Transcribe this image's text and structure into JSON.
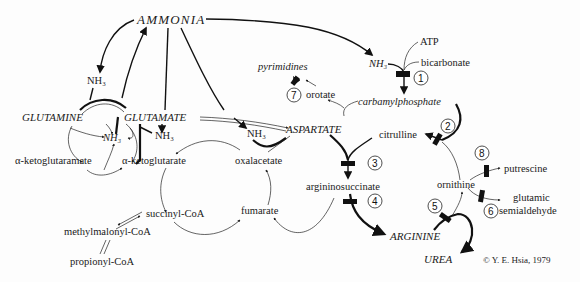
{
  "diagram": {
    "nodes": {
      "ammonia": "AMMONIA",
      "glutamine": "GLUTAMINE",
      "glutamate": "GLUTAMATE",
      "aspartate": "ASPARTATE",
      "arginine": "ARGININE",
      "urea": "UREA",
      "nh3_left": "NH₃",
      "nh3_center": "NH₃",
      "nh3_glutamate": "NH₃",
      "nh3_aspartate": "NH₃",
      "nh3_top": "NH₃",
      "atp": "ATP",
      "bicarbonate": "bicarbonate",
      "carbamylphosphate": "carbamylphosphate",
      "pyrimidines": "pyrimidines",
      "orotate": "orotate",
      "citrulline": "citrulline",
      "ornithine": "ornithine",
      "putrescine": "putrescine",
      "glutamic": "glutamic",
      "semialdehyde": "semialdehyde",
      "argininosuccinate": "argininosuccinate",
      "oxalacetate": "oxalacetate",
      "fumarate": "fumarate",
      "alpha_ketoglutarate": "α-ketoglutarate",
      "alpha_ketoglutaramate": "α-ketoglutaramate",
      "succinyl_coa": "succinyl-CoA",
      "methylmalonyl_coa": "methylmalonyl-CoA",
      "propionyl_coa": "propionyl-CoA"
    },
    "enzyme_steps": [
      "1",
      "2",
      "3",
      "4",
      "5",
      "6",
      "7",
      "8"
    ],
    "copyright": "© Y. E. Hsia, 1979"
  }
}
